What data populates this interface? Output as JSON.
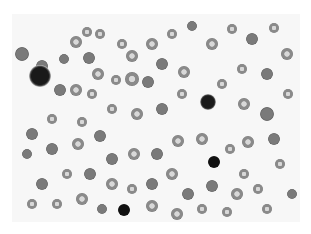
{
  "image": {
    "description": "Grayscale light-microscopy blood smear showing numerous red blood cells, several with central pallor, some irregular forms, and a few dark nucleated cells",
    "colors": {
      "background": "#f7f7f7",
      "cell": "#8a8a8a",
      "nucleus": "#1a1a1a"
    },
    "cells": [
      {
        "x": 10,
        "y": 40,
        "r": 7,
        "t": "rbcd"
      },
      {
        "x": 30,
        "y": 52,
        "r": 6,
        "t": "rbcd"
      },
      {
        "x": 52,
        "y": 45,
        "r": 5,
        "t": "rbcd"
      },
      {
        "x": 64,
        "y": 28,
        "r": 6,
        "t": "rbc"
      },
      {
        "x": 75,
        "y": 18,
        "r": 5,
        "t": "rbc"
      },
      {
        "x": 77,
        "y": 44,
        "r": 6,
        "t": "rbcd"
      },
      {
        "x": 86,
        "y": 60,
        "r": 6,
        "t": "rbc"
      },
      {
        "x": 88,
        "y": 20,
        "r": 5,
        "t": "rbc"
      },
      {
        "x": 110,
        "y": 30,
        "r": 5,
        "t": "rbc"
      },
      {
        "x": 120,
        "y": 42,
        "r": 6,
        "t": "rbc"
      },
      {
        "x": 140,
        "y": 30,
        "r": 6,
        "t": "rbc"
      },
      {
        "x": 150,
        "y": 50,
        "r": 6,
        "t": "rbcd"
      },
      {
        "x": 28,
        "y": 62,
        "r": 11,
        "t": "wbc"
      },
      {
        "x": 48,
        "y": 76,
        "r": 6,
        "t": "rbcd"
      },
      {
        "x": 64,
        "y": 76,
        "r": 6,
        "t": "rbc"
      },
      {
        "x": 80,
        "y": 80,
        "r": 5,
        "t": "rbc"
      },
      {
        "x": 104,
        "y": 66,
        "r": 5,
        "t": "rbc"
      },
      {
        "x": 120,
        "y": 65,
        "r": 7,
        "t": "rbc"
      },
      {
        "x": 136,
        "y": 68,
        "r": 6,
        "t": "rbcd"
      },
      {
        "x": 160,
        "y": 20,
        "r": 5,
        "t": "rbc"
      },
      {
        "x": 180,
        "y": 12,
        "r": 5,
        "t": "rbcd"
      },
      {
        "x": 200,
        "y": 30,
        "r": 6,
        "t": "rbc"
      },
      {
        "x": 220,
        "y": 15,
        "r": 5,
        "t": "rbc"
      },
      {
        "x": 240,
        "y": 25,
        "r": 6,
        "t": "rbcd"
      },
      {
        "x": 262,
        "y": 14,
        "r": 5,
        "t": "rbc"
      },
      {
        "x": 275,
        "y": 40,
        "r": 6,
        "t": "rbc"
      },
      {
        "x": 255,
        "y": 60,
        "r": 6,
        "t": "rbcd"
      },
      {
        "x": 230,
        "y": 55,
        "r": 5,
        "t": "rbc"
      },
      {
        "x": 196,
        "y": 88,
        "r": 8,
        "t": "wbc"
      },
      {
        "x": 210,
        "y": 70,
        "r": 5,
        "t": "rbc"
      },
      {
        "x": 232,
        "y": 90,
        "r": 6,
        "t": "rbc"
      },
      {
        "x": 255,
        "y": 100,
        "r": 7,
        "t": "rbcd"
      },
      {
        "x": 276,
        "y": 80,
        "r": 5,
        "t": "rbc"
      },
      {
        "x": 172,
        "y": 58,
        "r": 6,
        "t": "rbc"
      },
      {
        "x": 170,
        "y": 80,
        "r": 5,
        "t": "rbc"
      },
      {
        "x": 150,
        "y": 95,
        "r": 6,
        "t": "rbcd"
      },
      {
        "x": 125,
        "y": 100,
        "r": 6,
        "t": "rbc"
      },
      {
        "x": 100,
        "y": 95,
        "r": 5,
        "t": "rbc"
      },
      {
        "x": 70,
        "y": 108,
        "r": 5,
        "t": "rbc"
      },
      {
        "x": 40,
        "y": 105,
        "r": 5,
        "t": "rbc"
      },
      {
        "x": 20,
        "y": 120,
        "r": 6,
        "t": "rbcd"
      },
      {
        "x": 15,
        "y": 140,
        "r": 5,
        "t": "rbcd"
      },
      {
        "x": 40,
        "y": 135,
        "r": 6,
        "t": "rbcd"
      },
      {
        "x": 66,
        "y": 130,
        "r": 6,
        "t": "rbc"
      },
      {
        "x": 88,
        "y": 122,
        "r": 6,
        "t": "rbcd"
      },
      {
        "x": 100,
        "y": 145,
        "r": 6,
        "t": "rbcd"
      },
      {
        "x": 122,
        "y": 140,
        "r": 6,
        "t": "rbc"
      },
      {
        "x": 145,
        "y": 140,
        "r": 6,
        "t": "rbcd"
      },
      {
        "x": 166,
        "y": 127,
        "r": 6,
        "t": "rbc"
      },
      {
        "x": 190,
        "y": 125,
        "r": 6,
        "t": "rbc"
      },
      {
        "x": 202,
        "y": 148,
        "r": 6,
        "t": "nrbc"
      },
      {
        "x": 218,
        "y": 135,
        "r": 5,
        "t": "rbc"
      },
      {
        "x": 236,
        "y": 128,
        "r": 6,
        "t": "rbc"
      },
      {
        "x": 262,
        "y": 125,
        "r": 6,
        "t": "rbcd"
      },
      {
        "x": 268,
        "y": 150,
        "r": 5,
        "t": "rbc"
      },
      {
        "x": 232,
        "y": 160,
        "r": 5,
        "t": "rbc"
      },
      {
        "x": 246,
        "y": 175,
        "r": 5,
        "t": "rbc"
      },
      {
        "x": 225,
        "y": 180,
        "r": 6,
        "t": "rbc"
      },
      {
        "x": 200,
        "y": 172,
        "r": 6,
        "t": "rbcd"
      },
      {
        "x": 176,
        "y": 180,
        "r": 6,
        "t": "rbcd"
      },
      {
        "x": 160,
        "y": 160,
        "r": 6,
        "t": "rbc"
      },
      {
        "x": 140,
        "y": 170,
        "r": 6,
        "t": "rbcd"
      },
      {
        "x": 120,
        "y": 175,
        "r": 5,
        "t": "rbc"
      },
      {
        "x": 100,
        "y": 170,
        "r": 6,
        "t": "rbc"
      },
      {
        "x": 78,
        "y": 160,
        "r": 6,
        "t": "rbcd"
      },
      {
        "x": 55,
        "y": 160,
        "r": 5,
        "t": "rbc"
      },
      {
        "x": 30,
        "y": 170,
        "r": 6,
        "t": "rbcd"
      },
      {
        "x": 20,
        "y": 190,
        "r": 5,
        "t": "rbc"
      },
      {
        "x": 45,
        "y": 190,
        "r": 5,
        "t": "rbc"
      },
      {
        "x": 70,
        "y": 185,
        "r": 6,
        "t": "rbc"
      },
      {
        "x": 112,
        "y": 196,
        "r": 6,
        "t": "nrbc"
      },
      {
        "x": 140,
        "y": 192,
        "r": 6,
        "t": "rbc"
      },
      {
        "x": 165,
        "y": 200,
        "r": 6,
        "t": "rbc"
      },
      {
        "x": 190,
        "y": 195,
        "r": 5,
        "t": "rbc"
      },
      {
        "x": 215,
        "y": 198,
        "r": 5,
        "t": "rbc"
      },
      {
        "x": 255,
        "y": 195,
        "r": 5,
        "t": "rbc"
      },
      {
        "x": 280,
        "y": 180,
        "r": 5,
        "t": "rbcd"
      },
      {
        "x": 90,
        "y": 195,
        "r": 5,
        "t": "rbcd"
      }
    ]
  }
}
